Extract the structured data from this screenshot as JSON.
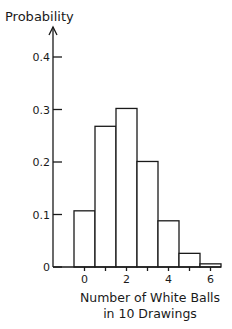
{
  "chart_data": {
    "type": "bar",
    "title": "",
    "ylabel": "Probability",
    "xlabel_lines": [
      "Number of White Balls",
      "in 10 Drawings"
    ],
    "categories": [
      0,
      1,
      2,
      3,
      4,
      5,
      6
    ],
    "values": [
      0.107,
      0.268,
      0.302,
      0.201,
      0.088,
      0.026,
      0.006
    ],
    "ylim": [
      0,
      0.45
    ],
    "yticks": [
      0,
      0.1,
      0.2,
      0.3,
      0.4
    ],
    "ytick_labels": [
      "0",
      "0.1",
      "0.2",
      "0.3",
      "0.4"
    ],
    "xticks": [
      0,
      1,
      2,
      3,
      4,
      5,
      6
    ],
    "xtick_labels": [
      "0",
      "",
      "2",
      "",
      "4",
      "",
      "6"
    ],
    "grid": false,
    "legend": null
  }
}
